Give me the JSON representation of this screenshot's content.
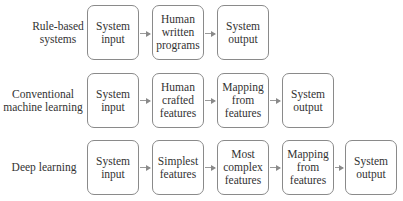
{
  "diagram": {
    "type": "flow-comparison",
    "rows": [
      {
        "label": "Rule-based\nsystems",
        "boxes": [
          "System\ninput",
          "Human\nwritten\nprograms",
          "System\noutput"
        ]
      },
      {
        "label": "Conventional\nmachine learning",
        "boxes": [
          "System\ninput",
          "Human\ncrafted\nfeatures",
          "Mapping\nfrom\nfeatures",
          "System\noutput"
        ]
      },
      {
        "label": "Deep learning",
        "boxes": [
          "System\ninput",
          "Simplest\nfeatures",
          "Most\ncomplex\nfeatures",
          "Mapping\nfrom\nfeatures",
          "System\noutput"
        ]
      }
    ],
    "colors": {
      "border": "#8a8a8a",
      "arrow": "#8a8a8a",
      "text": "#333333",
      "background": "#ffffff"
    }
  }
}
